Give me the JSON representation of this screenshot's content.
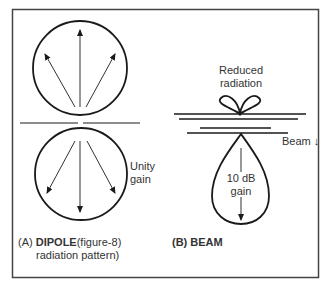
{
  "panel_a": {
    "caption_prefix": "(A)",
    "caption_title": "DIPOLE",
    "caption_rest": "(figure-8)",
    "caption_line2": "radiation pattern)",
    "annotation_line1": "Unity",
    "annotation_line2": "gain"
  },
  "panel_b": {
    "caption": "(B) BEAM",
    "top_label_line1": "Reduced",
    "top_label_line2": "radiation",
    "beam_label": "Beam ↓",
    "gain_line1": "10 dB",
    "gain_line2": "gain"
  },
  "colors": {
    "stroke": "#1a1a1a",
    "frame": "#444444"
  }
}
